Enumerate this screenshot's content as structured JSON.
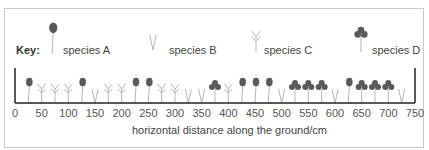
{
  "key": {
    "label": "Key:",
    "items": [
      {
        "species": "A",
        "label": "species A",
        "icon": "round-leaf-plant-icon",
        "x": 52,
        "text_x": 63
      },
      {
        "species": "B",
        "label": "species B",
        "icon": "v-shaped-plant-icon",
        "x": 153,
        "text_x": 169
      },
      {
        "species": "C",
        "label": "species C",
        "icon": "branched-plant-icon",
        "x": 256,
        "text_x": 264
      },
      {
        "species": "D",
        "label": "species D",
        "icon": "clover-plant-icon",
        "x": 361,
        "text_x": 372
      }
    ]
  },
  "axis": {
    "label": "horizontal distance along the ground/cm",
    "ticks": [
      "0",
      "50",
      "100",
      "150",
      "200",
      "250",
      "300",
      "350",
      "400",
      "450",
      "500",
      "550",
      "600",
      "650",
      "700",
      "750"
    ]
  },
  "chart_data": {
    "type": "table",
    "xlabel": "horizontal distance along the ground/cm",
    "xlim": [
      0,
      750
    ],
    "sample_interval_cm": 25,
    "legend": [
      "species A",
      "species B",
      "species C",
      "species D"
    ],
    "positions_cm": [
      25,
      50,
      75,
      100,
      125,
      150,
      175,
      200,
      225,
      250,
      275,
      300,
      325,
      350,
      375,
      400,
      425,
      450,
      475,
      500,
      525,
      550,
      575,
      600,
      625,
      650,
      675,
      700,
      725
    ],
    "species": [
      "A",
      "C",
      "C",
      "C",
      "A",
      "B",
      "C",
      "C",
      "A",
      "A",
      "C",
      "C",
      "B",
      "B",
      "D",
      "C",
      "A",
      "A",
      "A",
      "B",
      "D",
      "D",
      "D",
      "B",
      "A",
      "D",
      "D",
      "D",
      "B"
    ],
    "counts": {
      "A": 8,
      "B": 6,
      "C": 9,
      "D": 7
    }
  },
  "colors": {
    "leaf_dark": "#5a5a5a",
    "stem_light": "#b5b5b5",
    "axis": "#222222"
  }
}
